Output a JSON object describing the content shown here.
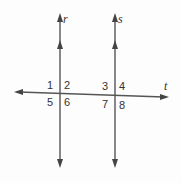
{
  "diagram": {
    "lines": {
      "r": {
        "label": "r",
        "type": "parallel"
      },
      "s": {
        "label": "s",
        "type": "parallel"
      },
      "t": {
        "label": "t",
        "type": "transversal"
      }
    },
    "angles": [
      "1",
      "2",
      "3",
      "4",
      "5",
      "6",
      "7",
      "8"
    ],
    "colors": {
      "line": "#555555",
      "text": "#333333",
      "background": "#fdfdfd"
    }
  }
}
